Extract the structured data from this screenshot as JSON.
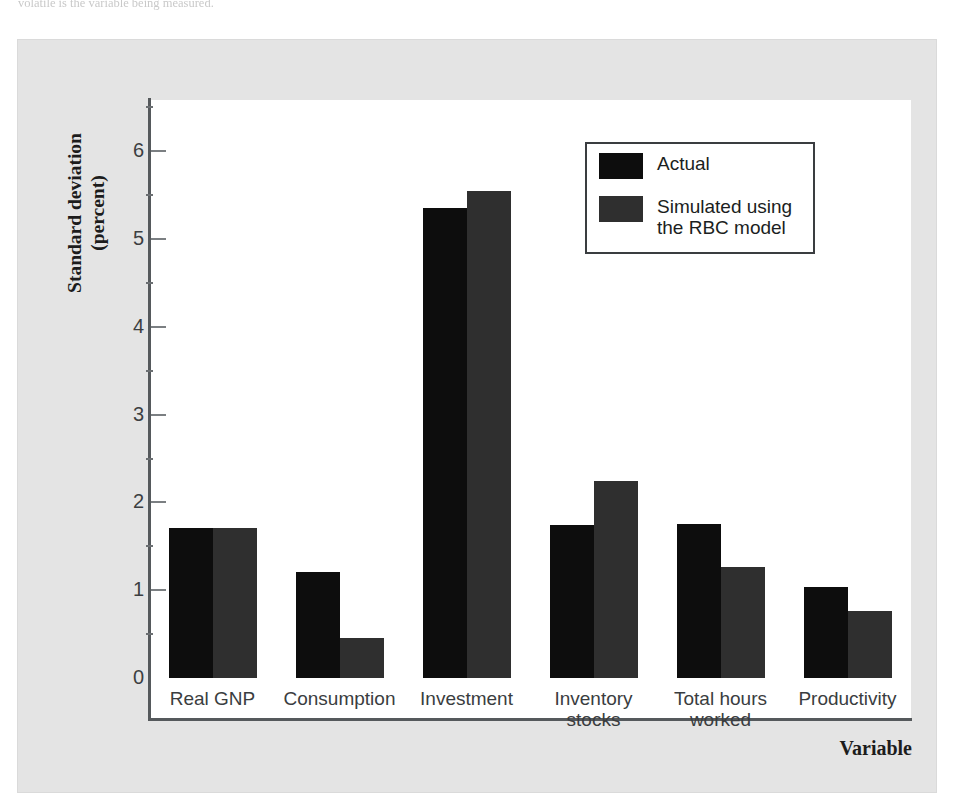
{
  "page": {
    "caption_fragment": "volatile is the variable being measured."
  },
  "figure": {
    "y_axis_title": "Standard deviation\n(percent)",
    "x_axis_title": "Variable",
    "y_ticks": [
      "0",
      "1",
      "2",
      "3",
      "4",
      "5",
      "6"
    ],
    "legend": {
      "entries": [
        {
          "label": "Actual",
          "color": "#0d0d0d",
          "swatch_name": "legend-swatch-actual"
        },
        {
          "label": "Simulated using\nthe RBC model",
          "color": "#2f2f2f",
          "swatch_name": "legend-swatch-simulated"
        }
      ]
    },
    "colors": {
      "actual": "#0d0d0d",
      "simulated": "#2f2f2f",
      "panel_background": "#e4e4e4",
      "plot_background": "#ffffff",
      "axis": "#55595c"
    }
  },
  "chart_data": {
    "type": "bar",
    "title": "",
    "xlabel": "Variable",
    "ylabel": "Standard deviation (percent)",
    "ylim": [
      0,
      6.6
    ],
    "yticks": [
      0,
      1,
      2,
      3,
      4,
      5,
      6
    ],
    "grid": false,
    "legend_position": "upper right",
    "categories": [
      "Real GNP",
      "Consumption",
      "Investment",
      "Inventory\nstocks",
      "Total hours\nworked",
      "Productivity"
    ],
    "series": [
      {
        "name": "Actual",
        "color": "#0d0d0d",
        "values": [
          1.71,
          1.21,
          5.35,
          1.74,
          1.75,
          1.04
        ]
      },
      {
        "name": "Simulated using the RBC model",
        "color": "#2f2f2f",
        "values": [
          1.71,
          0.46,
          5.55,
          2.24,
          1.26,
          0.76
        ]
      }
    ]
  }
}
